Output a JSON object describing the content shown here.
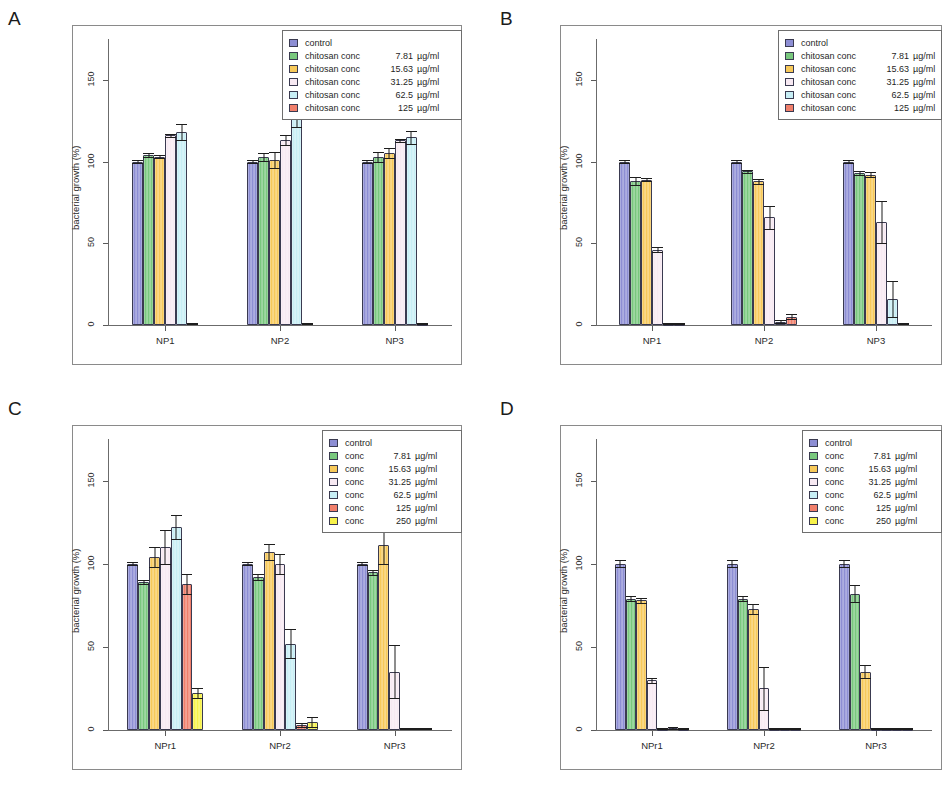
{
  "figure": {
    "ylabel": "bacterial growth (%)",
    "yticks": [
      "0",
      "50",
      "100",
      "150"
    ],
    "unit": "µg/ml"
  },
  "panels": [
    {
      "letter": "A",
      "ylabel": "bacterial growth (%)",
      "categories": [
        "NP1",
        "NP2",
        "NP3"
      ],
      "legend": [
        {
          "name": "control",
          "value": "",
          "unit": "",
          "color": "#8d8ed4"
        },
        {
          "name": "chitosan conc",
          "value": "7.81",
          "unit": "µg/ml",
          "color": "#79c87e"
        },
        {
          "name": "chitosan conc",
          "value": "15.63",
          "unit": "µg/ml",
          "color": "#f7c95a"
        },
        {
          "name": "chitosan conc",
          "value": "31.25",
          "unit": "µg/ml",
          "color": "#f7e9f2"
        },
        {
          "name": "chitosan conc",
          "value": "62.5",
          "unit": "µg/ml",
          "color": "#c7eef5"
        },
        {
          "name": "chitosan conc",
          "value": "125",
          "unit": "µg/ml",
          "color": "#f07f6b"
        }
      ]
    },
    {
      "letter": "B",
      "ylabel": "bacterial growth (%)",
      "categories": [
        "NP1",
        "NP2",
        "NP3"
      ],
      "legend": [
        {
          "name": "control",
          "value": "",
          "unit": "",
          "color": "#8d8ed4"
        },
        {
          "name": "chitosan conc",
          "value": "7.81",
          "unit": "µg/ml",
          "color": "#79c87e"
        },
        {
          "name": "chitosan conc",
          "value": "15.63",
          "unit": "µg/ml",
          "color": "#f7c95a"
        },
        {
          "name": "chitosan conc",
          "value": "31.25",
          "unit": "µg/ml",
          "color": "#f7e9f2"
        },
        {
          "name": "chitosan conc",
          "value": "62.5",
          "unit": "µg/ml",
          "color": "#c7eef5"
        },
        {
          "name": "chitosan conc",
          "value": "125",
          "unit": "µg/ml",
          "color": "#f07f6b"
        }
      ]
    },
    {
      "letter": "C",
      "ylabel": "bacterial growth (%)",
      "categories": [
        "NPr1",
        "NPr2",
        "NPr3"
      ],
      "legend": [
        {
          "name": "control",
          "value": "",
          "unit": "",
          "color": "#8d8ed4"
        },
        {
          "name": "conc",
          "value": "7.81",
          "unit": "µg/ml",
          "color": "#79c87e"
        },
        {
          "name": "conc",
          "value": "15.63",
          "unit": "µg/ml",
          "color": "#f7c95a"
        },
        {
          "name": "conc",
          "value": "31.25",
          "unit": "µg/ml",
          "color": "#f7e9f2"
        },
        {
          "name": "conc",
          "value": "62.5",
          "unit": "µg/ml",
          "color": "#c7eef5"
        },
        {
          "name": "conc",
          "value": "125",
          "unit": "µg/ml",
          "color": "#f07f6b"
        },
        {
          "name": "conc",
          "value": "250",
          "unit": "µg/ml",
          "color": "#f7f24a"
        }
      ]
    },
    {
      "letter": "D",
      "ylabel": "bacterial growth (%)",
      "categories": [
        "NPr1",
        "NPr2",
        "NPr3"
      ],
      "legend": [
        {
          "name": "control",
          "value": "",
          "unit": "",
          "color": "#8d8ed4"
        },
        {
          "name": "conc",
          "value": "7.81",
          "unit": "µg/ml",
          "color": "#79c87e"
        },
        {
          "name": "conc",
          "value": "15.63",
          "unit": "µg/ml",
          "color": "#f7c95a"
        },
        {
          "name": "conc",
          "value": "31.25",
          "unit": "µg/ml",
          "color": "#f7e9f2"
        },
        {
          "name": "conc",
          "value": "62.5",
          "unit": "µg/ml",
          "color": "#c7eef5"
        },
        {
          "name": "conc",
          "value": "125",
          "unit": "µg/ml",
          "color": "#f07f6b"
        },
        {
          "name": "conc",
          "value": "250",
          "unit": "µg/ml",
          "color": "#f7f24a"
        }
      ]
    }
  ],
  "chart_data": [
    {
      "type": "bar",
      "panel": "A",
      "title": "",
      "xlabel": "",
      "ylabel": "bacterial growth (%)",
      "ylim": [
        0,
        175
      ],
      "yticks": [
        0,
        50,
        100,
        150
      ],
      "grid": false,
      "legend_position": "top-right",
      "categories": [
        "NP1",
        "NP2",
        "NP3"
      ],
      "series": [
        {
          "name": "control",
          "color": "#8d8ed4",
          "values": [
            100,
            100,
            100
          ],
          "errors": [
            1,
            1,
            1
          ]
        },
        {
          "name": "chitosan conc 7.81 µg/ml",
          "color": "#79c87e",
          "values": [
            104,
            103,
            103
          ],
          "errors": [
            1.5,
            2.5,
            3
          ]
        },
        {
          "name": "chitosan conc 15.63 µg/ml",
          "color": "#f7c95a",
          "values": [
            103,
            101,
            105
          ],
          "errors": [
            1,
            5,
            3
          ]
        },
        {
          "name": "chitosan conc 31.25 µg/ml",
          "color": "#f7e9f2",
          "values": [
            116,
            113,
            113
          ],
          "errors": [
            1,
            3,
            1
          ]
        },
        {
          "name": "chitosan conc 62.5 µg/ml",
          "color": "#c7eef5",
          "values": [
            118,
            126,
            115
          ],
          "errors": [
            5,
            5,
            4
          ]
        },
        {
          "name": "chitosan conc 125 µg/ml",
          "color": "#f07f6b",
          "values": [
            1,
            1,
            0.8
          ],
          "errors": [
            0.3,
            0.3,
            0.3
          ]
        }
      ]
    },
    {
      "type": "bar",
      "panel": "B",
      "title": "",
      "xlabel": "",
      "ylabel": "bacterial growth (%)",
      "ylim": [
        0,
        175
      ],
      "yticks": [
        0,
        50,
        100,
        150
      ],
      "grid": false,
      "legend_position": "top-right",
      "categories": [
        "NP1",
        "NP2",
        "NP3"
      ],
      "series": [
        {
          "name": "control",
          "color": "#8d8ed4",
          "values": [
            100,
            100,
            100
          ],
          "errors": [
            1,
            1,
            1
          ]
        },
        {
          "name": "chitosan conc 7.81 µg/ml",
          "color": "#79c87e",
          "values": [
            88,
            94,
            93
          ],
          "errors": [
            2.5,
            1,
            1.5
          ]
        },
        {
          "name": "chitosan conc 15.63 µg/ml",
          "color": "#f7c95a",
          "values": [
            89,
            88,
            92
          ],
          "errors": [
            1,
            1.5,
            1.5
          ]
        },
        {
          "name": "chitosan conc 31.25 µg/ml",
          "color": "#f7e9f2",
          "values": [
            46,
            66,
            63
          ],
          "errors": [
            1.5,
            7,
            13
          ]
        },
        {
          "name": "chitosan conc 62.5 µg/ml",
          "color": "#c7eef5",
          "values": [
            0.8,
            2,
            16
          ],
          "errors": [
            0.3,
            0.8,
            11
          ]
        },
        {
          "name": "chitosan conc 125 µg/ml",
          "color": "#f07f6b",
          "values": [
            0.5,
            5,
            1
          ],
          "errors": [
            0.3,
            1.5,
            0.4
          ]
        }
      ]
    },
    {
      "type": "bar",
      "panel": "C",
      "title": "",
      "xlabel": "",
      "ylabel": "bacterial growth (%)",
      "ylim": [
        0,
        175
      ],
      "yticks": [
        0,
        50,
        100,
        150
      ],
      "grid": false,
      "legend_position": "top-right",
      "categories": [
        "NPr1",
        "NPr2",
        "NPr3"
      ],
      "series": [
        {
          "name": "control",
          "color": "#8d8ed4",
          "values": [
            100,
            100,
            100
          ],
          "errors": [
            1,
            1,
            1
          ]
        },
        {
          "name": "conc 7.81 µg/ml",
          "color": "#79c87e",
          "values": [
            89,
            92,
            95
          ],
          "errors": [
            1,
            2,
            1.5
          ]
        },
        {
          "name": "conc 15.63 µg/ml",
          "color": "#f7c95a",
          "values": [
            104,
            107,
            111
          ],
          "errors": [
            6,
            5,
            11
          ]
        },
        {
          "name": "conc 31.25 µg/ml",
          "color": "#f7e9f2",
          "values": [
            110,
            100,
            35
          ],
          "errors": [
            10,
            6,
            16
          ]
        },
        {
          "name": "conc 62.5 µg/ml",
          "color": "#c7eef5",
          "values": [
            122,
            52,
            1
          ],
          "errors": [
            7,
            9,
            0.5
          ]
        },
        {
          "name": "conc 125 µg/ml",
          "color": "#f07f6b",
          "values": [
            88,
            3,
            1
          ],
          "errors": [
            6,
            1,
            0.5
          ]
        },
        {
          "name": "conc 250 µg/ml",
          "color": "#f7f24a",
          "values": [
            22,
            5,
            1
          ],
          "errors": [
            3,
            3,
            0.5
          ]
        }
      ]
    },
    {
      "type": "bar",
      "panel": "D",
      "title": "",
      "xlabel": "",
      "ylabel": "bacterial growth (%)",
      "ylim": [
        0,
        175
      ],
      "yticks": [
        0,
        50,
        100,
        150
      ],
      "grid": false,
      "legend_position": "top-right",
      "categories": [
        "NPr1",
        "NPr2",
        "NPr3"
      ],
      "series": [
        {
          "name": "control",
          "color": "#8d8ed4",
          "values": [
            100,
            100,
            100
          ],
          "errors": [
            2,
            2,
            2
          ]
        },
        {
          "name": "conc 7.81 µg/ml",
          "color": "#79c87e",
          "values": [
            79,
            79,
            82
          ],
          "errors": [
            1.5,
            1.5,
            5
          ]
        },
        {
          "name": "conc 15.63 µg/ml",
          "color": "#f7c95a",
          "values": [
            78,
            73,
            35
          ],
          "errors": [
            1.5,
            3,
            4
          ]
        },
        {
          "name": "conc 31.25 µg/ml",
          "color": "#f7e9f2",
          "values": [
            30,
            25,
            0.8
          ],
          "errors": [
            1.5,
            13,
            0.4
          ]
        },
        {
          "name": "conc 62.5 µg/ml",
          "color": "#c7eef5",
          "values": [
            0.8,
            0.8,
            0.8
          ],
          "errors": [
            0.4,
            0.4,
            0.4
          ]
        },
        {
          "name": "conc 125 µg/ml",
          "color": "#f07f6b",
          "values": [
            1.2,
            0.8,
            0.8
          ],
          "errors": [
            0.4,
            0.4,
            0.4
          ]
        },
        {
          "name": "conc 250 µg/ml",
          "color": "#f7f24a",
          "values": [
            0.8,
            0.8,
            0.8
          ],
          "errors": [
            0.4,
            0.4,
            0.4
          ]
        }
      ]
    }
  ]
}
